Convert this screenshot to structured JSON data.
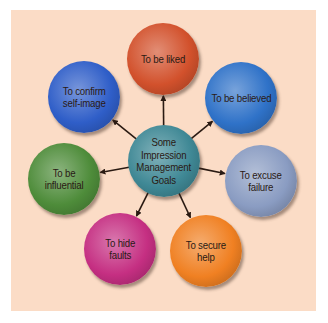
{
  "diagram": {
    "type": "hub-and-spoke",
    "background_color": "#fbdcc6",
    "center": {
      "label": "Some\nImpression\nManagement\nGoals",
      "color": "#3f8895",
      "cx": 164,
      "cy": 161
    },
    "goals": [
      {
        "id": "liked",
        "label": "To be liked",
        "color": "#d2512c",
        "cx": 163,
        "cy": 59
      },
      {
        "id": "believed",
        "label": "To be believed",
        "color": "#2f72c8",
        "cx": 241,
        "cy": 98
      },
      {
        "id": "excuse",
        "label": "To excuse\nfailure",
        "color": "#8a9cc2",
        "cx": 261,
        "cy": 181
      },
      {
        "id": "secure",
        "label": "To secure\nhelp",
        "color": "#f08022",
        "cx": 206,
        "cy": 251
      },
      {
        "id": "hide",
        "label": "To hide\nfaults",
        "color": "#c52f82",
        "cx": 120,
        "cy": 249
      },
      {
        "id": "influential",
        "label": "To be\ninfluential",
        "color": "#4e8c3a",
        "cx": 64,
        "cy": 179
      },
      {
        "id": "confirm",
        "label": "To confirm\nself-image",
        "color": "#2f5ec8",
        "cx": 84,
        "cy": 97
      }
    ],
    "edges": [
      {
        "from": "center",
        "to": "liked"
      },
      {
        "from": "center",
        "to": "believed"
      },
      {
        "from": "center",
        "to": "excuse"
      },
      {
        "from": "center",
        "to": "secure"
      },
      {
        "from": "center",
        "to": "hide"
      },
      {
        "from": "center",
        "to": "influential"
      },
      {
        "from": "center",
        "to": "confirm"
      }
    ]
  }
}
